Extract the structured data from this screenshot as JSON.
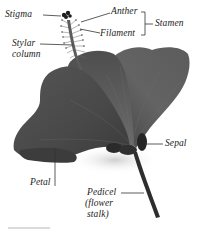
{
  "figure": {
    "labels": {
      "stigma": "Stigma",
      "anther": "Anther",
      "filament": "Filament",
      "stamen": "Stamen",
      "stylar_column_line1": "Stylar",
      "stylar_column_line2": "column",
      "sepal": "Sepal",
      "petal": "Petal",
      "pedicel_line1": "Pedicel",
      "pedicel_line2": "(flower",
      "pedicel_line3": "stalk)"
    },
    "colors": {
      "petal_dark": "#4a4a4a",
      "petal_mid": "#5e5e5e",
      "petal_light": "#7a7a7a",
      "leader_line": "#333333",
      "text": "#222222",
      "background": "#ffffff"
    }
  }
}
